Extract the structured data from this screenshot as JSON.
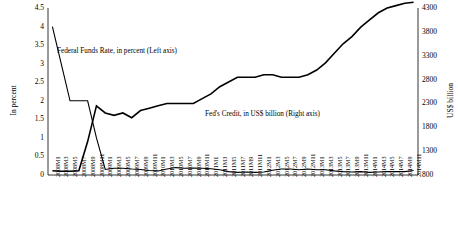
{
  "chart_data": {
    "type": "line",
    "title": "",
    "subtitle": "",
    "xlabel": "",
    "ylabel": "In percent",
    "y2label": "US$ billion",
    "grid": false,
    "legend_position": "inline-annotations",
    "annotations": [
      "Federal Funds Rate, in percent (Left axis)",
      "Fed's Credit, in US$ billion (Right axis)"
    ],
    "ylim": [
      0,
      4.5
    ],
    "yticks": [
      "0",
      "0.5",
      "1",
      "1.5",
      "2",
      "2.5",
      "3",
      "3.5",
      "4",
      "4.5"
    ],
    "y2lim": [
      800,
      4300
    ],
    "y2ticks": [
      "800",
      "1300",
      "1800",
      "2300",
      "2800",
      "3300",
      "3800",
      "4300"
    ],
    "categories": [
      "2008M1",
      "2008M3",
      "2008M5",
      "2008M7",
      "2008M9",
      "2008M11",
      "2009M1",
      "2009M3",
      "2009M5",
      "2009M7",
      "2009M9",
      "2009M11",
      "2010M1",
      "2010M3",
      "2010M5",
      "2010M7",
      "2010M9",
      "2010M11",
      "2011M1",
      "2011M3",
      "2011M5",
      "2011M7",
      "2011M9",
      "2011M11",
      "2012M1",
      "2012M3",
      "2012M5",
      "2012M7",
      "2012M9",
      "2012M11",
      "2013M1",
      "2013M3",
      "2013M5",
      "2013M7",
      "2013M9",
      "2013M11",
      "2014M1",
      "2014M3",
      "2014M5",
      "2014M7",
      "2014M9",
      "2014M11"
    ],
    "series": [
      {
        "name": "Federal Funds Rate, in percent (Left axis)",
        "axis": "left",
        "unit": "percent",
        "values": [
          4.0,
          3.0,
          2.0,
          2.0,
          2.0,
          1.0,
          0.15,
          0.18,
          0.18,
          0.16,
          0.15,
          0.12,
          0.11,
          0.16,
          0.2,
          0.18,
          0.19,
          0.18,
          0.17,
          0.14,
          0.09,
          0.07,
          0.08,
          0.07,
          0.08,
          0.13,
          0.16,
          0.16,
          0.14,
          0.16,
          0.14,
          0.14,
          0.11,
          0.09,
          0.08,
          0.09,
          0.07,
          0.08,
          0.09,
          0.09,
          0.09,
          0.12
        ]
      },
      {
        "name": "Fed's Credit, in US$ billion (Right axis)",
        "axis": "right",
        "unit": "US$ billion",
        "values": [
          890,
          880,
          880,
          890,
          1500,
          2250,
          2100,
          2050,
          2100,
          2000,
          2150,
          2200,
          2250,
          2300,
          2300,
          2300,
          2300,
          2400,
          2500,
          2650,
          2750,
          2850,
          2850,
          2850,
          2900,
          2900,
          2850,
          2850,
          2850,
          2900,
          3000,
          3150,
          3350,
          3550,
          3700,
          3900,
          4050,
          4200,
          4300,
          4350,
          4400,
          4420
        ]
      }
    ]
  }
}
